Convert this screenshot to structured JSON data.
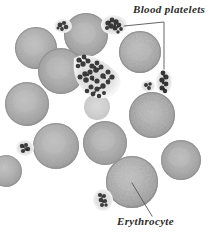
{
  "figure": {
    "kind": "blood-smear-micrograph",
    "background_color": "#ffffff",
    "width": 221,
    "height": 235
  },
  "labels": {
    "platelets": {
      "text": "Blood platelets",
      "color": "#2b2b2b",
      "style": "italic-serif"
    },
    "erythrocyte": {
      "text": "Erythrocyte",
      "color": "#2b2b2b",
      "style": "italic-serif"
    }
  },
  "leader_lines": {
    "platelets_color": "#555555",
    "erythrocyte_color": "#555555"
  },
  "palette": {
    "erythrocyte_fill": "#ababab",
    "erythrocyte_rim": "#8d8d8d",
    "erythrocyte_center": "#bcbcbc",
    "platelet_dark": "#3a3a3a",
    "platelet_halo": "#d8d8d8",
    "background": "#ffffff"
  },
  "cells": {
    "erythrocytes": [
      {
        "cx": 36,
        "cy": 48,
        "r": 21,
        "tone": "#adadad"
      },
      {
        "cx": 86,
        "cy": 35,
        "r": 22,
        "tone": "#b0b0b0"
      },
      {
        "cx": 140,
        "cy": 52,
        "r": 21,
        "tone": "#a9a9a9"
      },
      {
        "cx": 61,
        "cy": 71,
        "r": 23,
        "tone": "#aaaaaa"
      },
      {
        "cx": 27,
        "cy": 104,
        "r": 22,
        "tone": "#b0b0b0"
      },
      {
        "cx": 152,
        "cy": 115,
        "r": 23,
        "tone": "#a8a8a8"
      },
      {
        "cx": 56,
        "cy": 146,
        "r": 23,
        "tone": "#adadad"
      },
      {
        "cx": 105,
        "cy": 143,
        "r": 22,
        "tone": "#afafaf"
      },
      {
        "cx": 132,
        "cy": 182,
        "r": 26,
        "tone": "#a9a9a9"
      },
      {
        "cx": 181,
        "cy": 160,
        "r": 20,
        "tone": "#b2b2b2"
      },
      {
        "cx": 8,
        "cy": 171,
        "r": 16,
        "tone": "#b4b4b4"
      }
    ],
    "platelets": [
      {
        "cx": 63,
        "cy": 26,
        "rx": 8,
        "ry": 6,
        "kind": "small"
      },
      {
        "cx": 116,
        "cy": 25,
        "rx": 12,
        "ry": 9,
        "kind": "cluster"
      },
      {
        "cx": 93,
        "cy": 77,
        "rx": 26,
        "ry": 22,
        "kind": "chain"
      },
      {
        "cx": 164,
        "cy": 82,
        "rx": 7,
        "ry": 11,
        "kind": "elongated"
      },
      {
        "cx": 147,
        "cy": 86,
        "rx": 6,
        "ry": 5,
        "kind": "small"
      },
      {
        "cx": 25,
        "cy": 148,
        "rx": 8,
        "ry": 7,
        "kind": "small"
      },
      {
        "cx": 103,
        "cy": 200,
        "rx": 9,
        "ry": 10,
        "kind": "small"
      }
    ]
  }
}
